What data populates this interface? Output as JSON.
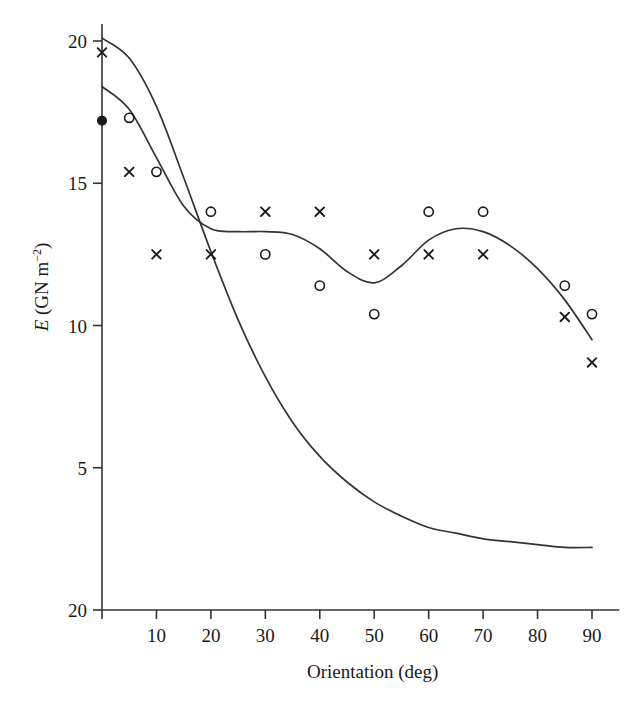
{
  "figure": {
    "background": "#ffffff",
    "ink_color": "#333333",
    "marker_color": "#1a1a1a"
  },
  "chart_data": {
    "type": "scatter",
    "title": "",
    "xlabel": "Orientation (deg)",
    "ylabel": "E (GN m−2)",
    "ylabel_parts": {
      "symbol": "E",
      "unit_open": " (GN m",
      "exponent": "−2",
      "unit_close": ")"
    },
    "xlim": [
      0,
      95
    ],
    "ylim": [
      0,
      20.6
    ],
    "grid": false,
    "legend": "none",
    "xticks": [
      0,
      10,
      20,
      30,
      40,
      50,
      60,
      70,
      80,
      90
    ],
    "xtick_labels": [
      "",
      "10",
      "20",
      "30",
      "40",
      "50",
      "60",
      "70",
      "80",
      "90"
    ],
    "yticks": [
      0,
      5,
      10,
      15,
      20
    ],
    "ytick_labels": [
      "20",
      "5",
      "10",
      "15",
      "20"
    ],
    "ytick_note": "bottom tick is printed as 20 in the original figure",
    "series": [
      {
        "name": "open-circle-data",
        "marker": "circle-open",
        "points": [
          {
            "x": 5,
            "y": 17.3
          },
          {
            "x": 10,
            "y": 15.4
          },
          {
            "x": 20,
            "y": 14.0
          },
          {
            "x": 30,
            "y": 12.5
          },
          {
            "x": 40,
            "y": 11.4
          },
          {
            "x": 50,
            "y": 10.4
          },
          {
            "x": 60,
            "y": 14.0
          },
          {
            "x": 70,
            "y": 14.0
          },
          {
            "x": 85,
            "y": 11.4
          },
          {
            "x": 90,
            "y": 10.4
          }
        ]
      },
      {
        "name": "cross-data",
        "marker": "cross",
        "points": [
          {
            "x": 0,
            "y": 19.6
          },
          {
            "x": 5,
            "y": 15.4
          },
          {
            "x": 10,
            "y": 12.5
          },
          {
            "x": 20,
            "y": 12.5
          },
          {
            "x": 30,
            "y": 14.0
          },
          {
            "x": 40,
            "y": 14.0
          },
          {
            "x": 50,
            "y": 12.5
          },
          {
            "x": 60,
            "y": 12.5
          },
          {
            "x": 70,
            "y": 12.5
          },
          {
            "x": 85,
            "y": 10.3
          },
          {
            "x": 90,
            "y": 8.7
          }
        ]
      },
      {
        "name": "filled-circle-data",
        "marker": "circle-filled",
        "points": [
          {
            "x": 0,
            "y": 17.2
          }
        ]
      },
      {
        "name": "upper-model-curve",
        "marker": "line",
        "points": [
          {
            "x": 0,
            "y": 18.4
          },
          {
            "x": 5,
            "y": 17.6
          },
          {
            "x": 10,
            "y": 15.9
          },
          {
            "x": 15,
            "y": 14.2
          },
          {
            "x": 20,
            "y": 13.4
          },
          {
            "x": 25,
            "y": 13.3
          },
          {
            "x": 30,
            "y": 13.3
          },
          {
            "x": 35,
            "y": 13.2
          },
          {
            "x": 40,
            "y": 12.7
          },
          {
            "x": 45,
            "y": 11.9
          },
          {
            "x": 50,
            "y": 11.5
          },
          {
            "x": 55,
            "y": 12.1
          },
          {
            "x": 60,
            "y": 13.0
          },
          {
            "x": 65,
            "y": 13.4
          },
          {
            "x": 70,
            "y": 13.3
          },
          {
            "x": 75,
            "y": 12.8
          },
          {
            "x": 80,
            "y": 12.0
          },
          {
            "x": 85,
            "y": 10.9
          },
          {
            "x": 90,
            "y": 9.5
          }
        ]
      },
      {
        "name": "lower-model-curve",
        "marker": "line",
        "points": [
          {
            "x": 0,
            "y": 20.1
          },
          {
            "x": 5,
            "y": 19.4
          },
          {
            "x": 10,
            "y": 17.7
          },
          {
            "x": 15,
            "y": 15.2
          },
          {
            "x": 20,
            "y": 12.6
          },
          {
            "x": 25,
            "y": 10.2
          },
          {
            "x": 30,
            "y": 8.2
          },
          {
            "x": 35,
            "y": 6.6
          },
          {
            "x": 40,
            "y": 5.4
          },
          {
            "x": 45,
            "y": 4.5
          },
          {
            "x": 50,
            "y": 3.8
          },
          {
            "x": 55,
            "y": 3.3
          },
          {
            "x": 60,
            "y": 2.9
          },
          {
            "x": 65,
            "y": 2.7
          },
          {
            "x": 70,
            "y": 2.5
          },
          {
            "x": 75,
            "y": 2.4
          },
          {
            "x": 80,
            "y": 2.3
          },
          {
            "x": 85,
            "y": 2.2
          },
          {
            "x": 90,
            "y": 2.2
          }
        ]
      }
    ]
  }
}
